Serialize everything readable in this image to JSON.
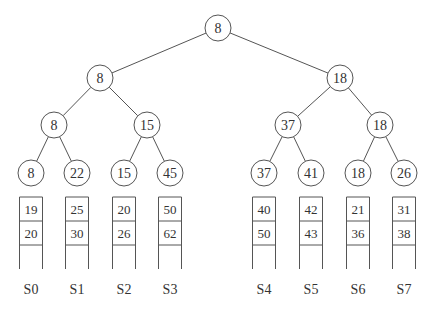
{
  "diagram": {
    "type": "tournament-tree-with-sorted-runs",
    "colors": {
      "stroke": "#555555",
      "text": "#333333",
      "background": "#ffffff"
    },
    "tree": {
      "root": {
        "value": "8",
        "x": 218,
        "y": 28
      },
      "level1": [
        {
          "value": "8",
          "x": 100,
          "y": 78
        },
        {
          "value": "18",
          "x": 340,
          "y": 78
        }
      ],
      "level2": [
        {
          "value": "8",
          "x": 54,
          "y": 125
        },
        {
          "value": "15",
          "x": 147,
          "y": 125
        },
        {
          "value": "37",
          "x": 288,
          "y": 125
        },
        {
          "value": "18",
          "x": 380,
          "y": 125
        }
      ],
      "leaves": [
        {
          "value": "8",
          "x": 31,
          "y": 173
        },
        {
          "value": "22",
          "x": 77,
          "y": 173
        },
        {
          "value": "15",
          "x": 124,
          "y": 173
        },
        {
          "value": "45",
          "x": 170,
          "y": 173
        },
        {
          "value": "37",
          "x": 264,
          "y": 173
        },
        {
          "value": "41",
          "x": 311,
          "y": 173
        },
        {
          "value": "18",
          "x": 358,
          "y": 173
        },
        {
          "value": "26",
          "x": 404,
          "y": 173
        }
      ]
    },
    "sequences": [
      {
        "label": "S0",
        "x": 31,
        "values": [
          "19",
          "20"
        ]
      },
      {
        "label": "S1",
        "x": 77,
        "values": [
          "25",
          "30"
        ]
      },
      {
        "label": "S2",
        "x": 124,
        "values": [
          "20",
          "26"
        ]
      },
      {
        "label": "S3",
        "x": 170,
        "values": [
          "50",
          "62"
        ]
      },
      {
        "label": "S4",
        "x": 264,
        "values": [
          "40",
          "50"
        ]
      },
      {
        "label": "S5",
        "x": 311,
        "values": [
          "42",
          "43"
        ]
      },
      {
        "label": "S6",
        "x": 358,
        "values": [
          "21",
          "36"
        ]
      },
      {
        "label": "S7",
        "x": 404,
        "values": [
          "31",
          "38"
        ]
      }
    ]
  }
}
